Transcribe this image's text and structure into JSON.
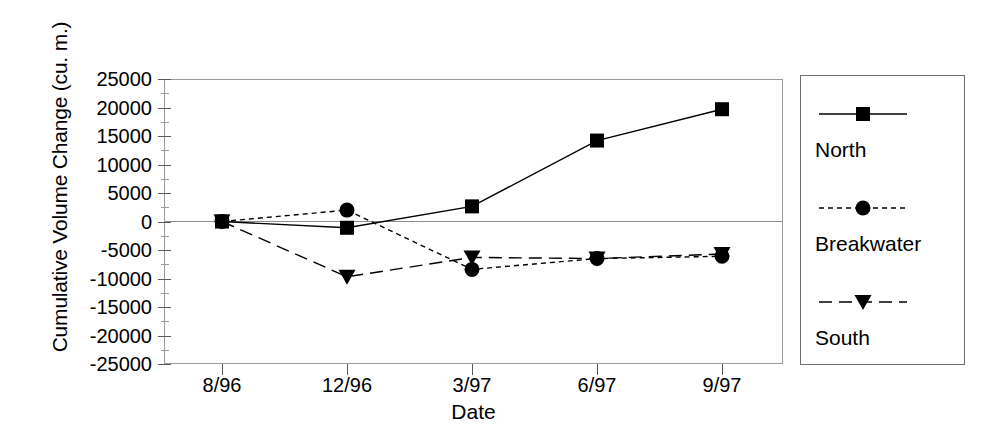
{
  "chart_data": {
    "type": "line",
    "title": "",
    "xlabel": "Date",
    "ylabel": "Cumulative Volume Change (cu. m.)",
    "categories": [
      "8/96",
      "12/96",
      "3/97",
      "6/97",
      "9/97"
    ],
    "ylim": [
      -25000,
      25000
    ],
    "ytick_step": 5000,
    "yticks": [
      25000,
      20000,
      15000,
      10000,
      5000,
      0,
      -5000,
      -10000,
      -15000,
      -20000,
      -25000
    ],
    "ytick_labels": [
      "25000",
      "20000",
      "15000",
      "10000",
      "5000",
      "0",
      "-5000",
      "-10000",
      "-15000",
      "-20000",
      "-25000"
    ],
    "grid": false,
    "legend_position": "right",
    "series": [
      {
        "name": "North",
        "marker": "square",
        "linestyle": "solid",
        "color": "#000000",
        "values": [
          0,
          -1100,
          2650,
          14200,
          19700
        ]
      },
      {
        "name": "Breakwater",
        "marker": "circle",
        "linestyle": "dotted",
        "color": "#000000",
        "values": [
          0,
          2000,
          -8400,
          -6500,
          -6100
        ]
      },
      {
        "name": "South",
        "marker": "triangle-down",
        "linestyle": "dashed",
        "color": "#000000",
        "values": [
          0,
          -9700,
          -6300,
          -6500,
          -5700
        ]
      }
    ]
  },
  "legend": {
    "entries": [
      {
        "label": "North",
        "marker": "square-marker-icon",
        "linestyle": "solid"
      },
      {
        "label": "Breakwater",
        "marker": "circle-marker-icon",
        "linestyle": "dotted"
      },
      {
        "label": "South",
        "marker": "triangle-down-marker-icon",
        "linestyle": "dashed"
      }
    ]
  }
}
